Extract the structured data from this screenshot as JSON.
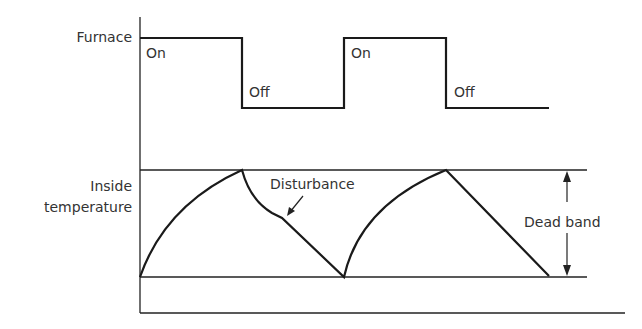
{
  "diagram": {
    "type": "on-off control timing diagram",
    "furnace": {
      "label": "Furnace",
      "states": [
        {
          "state": "On",
          "x_start": 140,
          "x_end": 242
        },
        {
          "state": "Off",
          "x_start": 242,
          "x_end": 344
        },
        {
          "state": "On",
          "x_start": 344,
          "x_end": 446
        },
        {
          "state": "Off",
          "x_start": 446,
          "x_end": 549
        }
      ]
    },
    "temperature": {
      "label_line1": "Inside",
      "label_line2": "temperature",
      "disturbance_label": "Disturbance",
      "dead_band_label": "Dead band"
    },
    "colors": {
      "line": "#1a1a1a",
      "text": "#333333",
      "background": "#ffffff"
    }
  },
  "labels": {
    "furnace": "Furnace",
    "on1": "On",
    "off1": "Off",
    "on2": "On",
    "off2": "Off",
    "inside": "Inside",
    "temperature": "temperature",
    "disturbance": "Disturbance",
    "dead_band": "Dead band"
  }
}
